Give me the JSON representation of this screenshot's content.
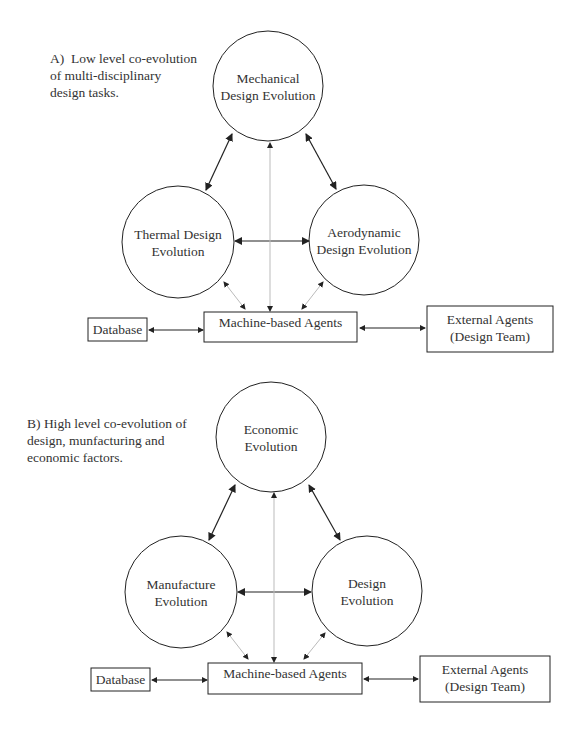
{
  "panel_a": {
    "caption": "A)  Low level co-evolution\nof multi-disciplinary\ndesign tasks.",
    "top_node": "Mechanical\nDesign Evolution",
    "left_node": "Thermal Design\nEvolution",
    "right_node": "Aerodynamic\nDesign Evolution",
    "database": "Database",
    "machine_agents": "Machine-based Agents",
    "external_agents": "External Agents\n(Design Team)"
  },
  "panel_b": {
    "caption": "B) High level co-evolution of\ndesign, munfacturing and\neconomic factors.",
    "top_node": "Economic\nEvolution",
    "left_node": "Manufacture\nEvolution",
    "right_node": "Design\nEvolution",
    "database": "Database",
    "machine_agents": "Machine-based Agents",
    "external_agents": "External Agents\n(Design Team)"
  },
  "colors": {
    "line": "#222222",
    "dotted_line": "#bbbbbb",
    "text": "#333333"
  }
}
